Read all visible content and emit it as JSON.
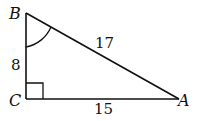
{
  "figure": {
    "type": "right-triangle",
    "vertices": {
      "A": {
        "label": "A"
      },
      "B": {
        "label": "B"
      },
      "C": {
        "label": "C"
      }
    },
    "sides": {
      "BC": "8",
      "CA": "15",
      "AB": "17"
    },
    "right_angle_at": "C",
    "marked_angle_at": "B"
  }
}
